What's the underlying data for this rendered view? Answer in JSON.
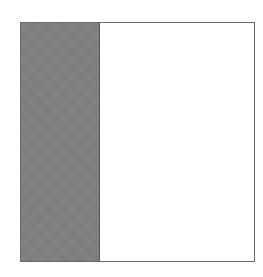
{
  "diagram": {
    "shape": "square-outline",
    "regions": [
      {
        "name": "filled-strip",
        "fill": "#7f7f7f",
        "fraction": 0.33
      },
      {
        "name": "empty-region",
        "fill": "#ffffff",
        "fraction": 0.67
      }
    ],
    "border_color": "#6a6a6a"
  }
}
